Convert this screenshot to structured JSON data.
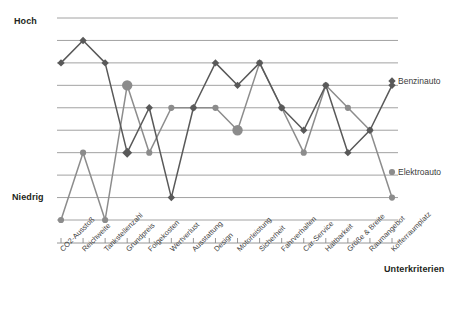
{
  "chart_data": {
    "type": "line",
    "title": "",
    "xlabel": "Unterkriterien",
    "ylabel": "",
    "grid": true,
    "legend_position": "right-inline",
    "ylim": [
      1,
      10
    ],
    "ytick_labels": [
      "Niedrig",
      "Hoch"
    ],
    "categories": [
      "CO2-Ausstoß",
      "Reichweite",
      "Tankstellenzahl",
      "Grundpreis",
      "Folgekosten",
      "Wertverlust",
      "Ausstattung",
      "Design",
      "Motorleistung",
      "Sicherheit",
      "Fahrverhalten",
      "Car-Service",
      "Haltbarkeit",
      "Größe & Breite",
      "Raumangebot",
      "Kofferraumplatz"
    ],
    "series": [
      {
        "name": "Benzinauto",
        "color": "#595959",
        "marker": "diamond",
        "values": [
          8.0,
          9.0,
          8.0,
          4.0,
          6.0,
          2.0,
          6.0,
          8.0,
          7.0,
          8.0,
          6.0,
          5.0,
          7.0,
          4.0,
          5.0,
          7.0
        ]
      },
      {
        "name": "Elektroauto",
        "color": "#8c8c8c",
        "marker": "circle",
        "values": [
          1.0,
          4.0,
          1.0,
          7.0,
          4.0,
          6.0,
          6.0,
          6.0,
          5.0,
          8.0,
          6.0,
          4.0,
          7.0,
          6.0,
          5.0,
          2.0
        ]
      }
    ],
    "annotations": {
      "axis_high": "Hoch",
      "axis_low": "Niedrig",
      "x_axis_title": "Unterkriterien"
    }
  }
}
